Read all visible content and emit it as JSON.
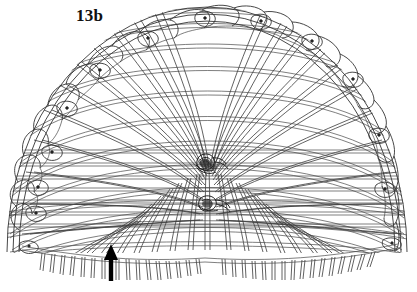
{
  "figure": {
    "label": "13b",
    "caption_text": "13b",
    "kind": "line-drawing",
    "background_color": "#ffffff",
    "line_color": "#3a3a3a",
    "accent_color": "#000000"
  },
  "annotations": {
    "arrow": {
      "name": "pointer-arrow",
      "direction": "up",
      "tip_x": 111,
      "tip_y": 244,
      "tail_y": 281,
      "color": "#000000"
    }
  },
  "structure": {
    "dome": {
      "center_x": 207,
      "base_y": 247,
      "radius_x": 200,
      "radius_y": 247
    },
    "rim_marker_count": 14,
    "warp_count": 34,
    "weft_band_count": 11,
    "fringe_count": 60,
    "knots": [
      {
        "name": "upper-center-knot",
        "x": 206,
        "y": 164
      },
      {
        "name": "lower-center-knot",
        "x": 207,
        "y": 205
      }
    ]
  }
}
